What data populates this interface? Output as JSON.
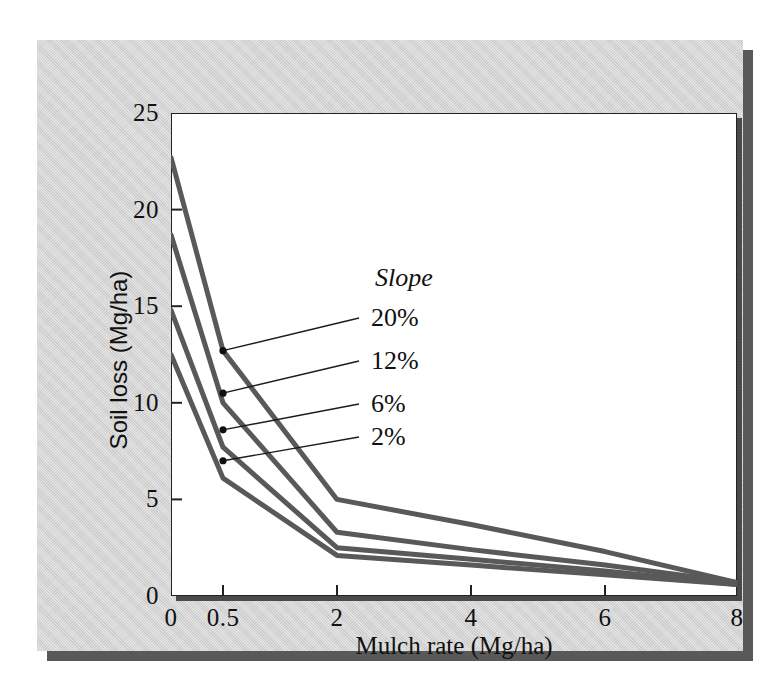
{
  "chart_data": {
    "type": "line",
    "title": "",
    "xlabel": "Mulch rate (Mg/ha)",
    "ylabel": "Soil loss (Mg/ha)",
    "legend_title": "Slope",
    "legend_position": "inline-callout",
    "grid": false,
    "x": [
      0,
      0.5,
      2,
      4,
      6,
      8
    ],
    "xlim": [
      0,
      8
    ],
    "ylim": [
      0,
      25
    ],
    "xticks": [
      "0",
      "0.5",
      "2",
      "4",
      "6",
      "8"
    ],
    "xtick_values": [
      0,
      0.5,
      2,
      4,
      6,
      8
    ],
    "yticks": [
      "0",
      "5",
      "10",
      "15",
      "20",
      "25"
    ],
    "ytick_values": [
      0,
      5,
      10,
      15,
      20,
      25
    ],
    "series": [
      {
        "name": "20%",
        "values": [
          22.7,
          12.7,
          5.0,
          3.7,
          2.3,
          0.7
        ]
      },
      {
        "name": "12%",
        "values": [
          18.7,
          10.0,
          3.3,
          2.4,
          1.6,
          0.7
        ]
      },
      {
        "name": "6%",
        "values": [
          14.8,
          7.7,
          2.5,
          1.9,
          1.3,
          0.6
        ]
      },
      {
        "name": "2%",
        "values": [
          12.5,
          6.1,
          2.1,
          1.6,
          1.1,
          0.6
        ]
      }
    ],
    "callouts": [
      {
        "label": "20%",
        "anchor_x": 0.5,
        "anchor_y": 12.7
      },
      {
        "label": "12%",
        "anchor_x": 0.5,
        "anchor_y": 10.5
      },
      {
        "label": "6%",
        "anchor_x": 0.5,
        "anchor_y": 8.6
      },
      {
        "label": "2%",
        "anchor_x": 0.5,
        "anchor_y": 7.0
      }
    ],
    "colors": {
      "series_line": "#595959",
      "axis": "#222222",
      "panel_background": "#d2d2d2",
      "plot_background": "#ffffff",
      "text": "#111111",
      "shadow": "#595959"
    }
  }
}
